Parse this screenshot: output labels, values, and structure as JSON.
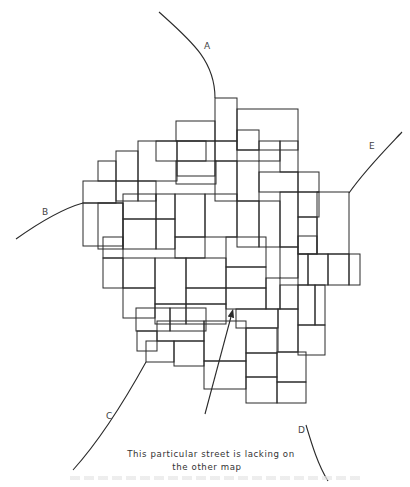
{
  "figure": {
    "type": "street-map-line-drawing",
    "stroke_color": "#2a2a2a",
    "background": "#ffffff",
    "road_labels": [
      {
        "id": "A",
        "text": "A",
        "x": 204,
        "y": 49
      },
      {
        "id": "B",
        "text": "B",
        "x": 42,
        "y": 215
      },
      {
        "id": "C",
        "text": "C",
        "x": 106,
        "y": 419
      },
      {
        "id": "D",
        "text": "D",
        "x": 298,
        "y": 433
      },
      {
        "id": "E",
        "text": "E",
        "x": 369,
        "y": 149
      }
    ],
    "roads": [
      {
        "id": "A",
        "d": "M159 12 C190 40 215 60 215 98"
      },
      {
        "id": "B",
        "d": "M16 239 C40 222 65 208 83 203"
      },
      {
        "id": "C",
        "d": "M73 470 C100 440 125 400 146 362"
      },
      {
        "id": "D",
        "d": "M306 425 C312 445 318 465 328 481"
      },
      {
        "id": "E",
        "d": "M402 132 C385 150 365 170 349 193"
      }
    ],
    "annotation": {
      "line1": "This particular street is lacking on",
      "line2": "the other map",
      "arrow": {
        "x1": 205,
        "y1": 414,
        "x2": 232,
        "y2": 313
      }
    },
    "caption_faint": ""
  }
}
